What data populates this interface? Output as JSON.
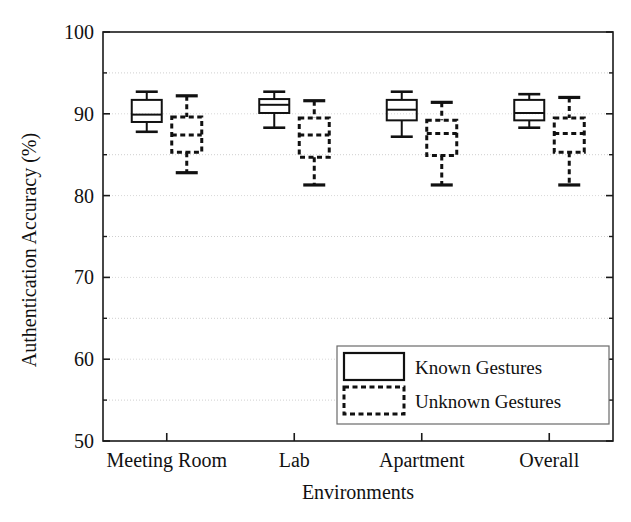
{
  "chart_data": {
    "type": "box",
    "title": "",
    "xlabel": "Environments",
    "ylabel": "Authentication Accuracy (%)",
    "categories": [
      "Meeting Room",
      "Lab",
      "Apartment",
      "Overall"
    ],
    "ylim": [
      50,
      100
    ],
    "yticks": [
      50,
      60,
      70,
      80,
      90,
      100
    ],
    "ytick_labels": [
      "50",
      "60",
      "70",
      "80",
      "90",
      "100"
    ],
    "yminor_gridlines": [
      55,
      65,
      75,
      85,
      95
    ],
    "ymajor_gridlines": [
      60,
      70,
      80,
      90
    ],
    "grid": true,
    "legend_position": "lower right",
    "legend": [
      "Known Gestures",
      "Unknown Gestures"
    ],
    "series": [
      {
        "name": "Known Gestures",
        "style": "solid",
        "boxes": [
          {
            "category": "Meeting Room",
            "whisker_low": 87.8,
            "q1": 89.0,
            "median": 89.9,
            "q3": 91.7,
            "whisker_high": 92.7
          },
          {
            "category": "Lab",
            "whisker_low": 88.3,
            "q1": 90.1,
            "median": 91.1,
            "q3": 91.8,
            "whisker_high": 92.7
          },
          {
            "category": "Apartment",
            "whisker_low": 87.2,
            "q1": 89.2,
            "median": 90.5,
            "q3": 91.7,
            "whisker_high": 92.7
          },
          {
            "category": "Overall",
            "whisker_low": 88.3,
            "q1": 89.2,
            "median": 90.1,
            "q3": 91.7,
            "whisker_high": 92.4
          }
        ]
      },
      {
        "name": "Unknown Gestures",
        "style": "dashed",
        "boxes": [
          {
            "category": "Meeting Room",
            "whisker_low": 82.8,
            "q1": 85.3,
            "median": 87.4,
            "q3": 89.6,
            "whisker_high": 92.2
          },
          {
            "category": "Lab",
            "whisker_low": 81.3,
            "q1": 84.7,
            "median": 87.4,
            "q3": 89.5,
            "whisker_high": 91.6
          },
          {
            "category": "Apartment",
            "whisker_low": 81.3,
            "q1": 84.9,
            "median": 87.6,
            "q3": 89.2,
            "whisker_high": 91.4
          },
          {
            "category": "Overall",
            "whisker_low": 81.3,
            "q1": 85.3,
            "median": 87.6,
            "q3": 89.5,
            "whisker_high": 92.0
          }
        ]
      }
    ]
  }
}
